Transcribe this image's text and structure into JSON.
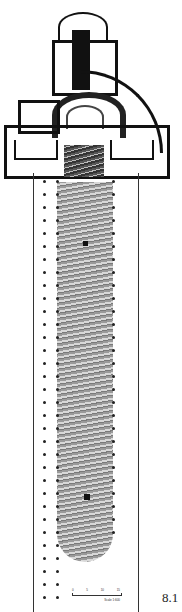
{
  "figure": {
    "label": "8.1",
    "type": "architectural-plan",
    "scale_bar": {
      "ticks": [
        "0",
        "5",
        "10",
        "15"
      ],
      "caption": "Scale 1:600"
    }
  }
}
